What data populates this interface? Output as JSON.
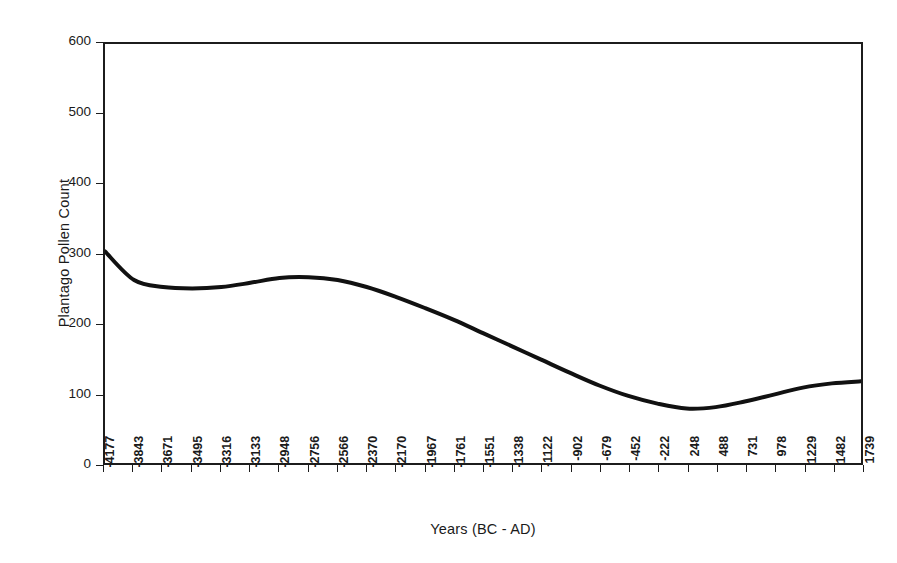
{
  "chart_data": {
    "type": "line",
    "title": "",
    "xlabel": "Years (BC - AD)",
    "ylabel": "Plantago Pollen Count",
    "grid": false,
    "legend": null,
    "ylim": [
      0,
      600
    ],
    "yticks": [
      0,
      100,
      200,
      300,
      400,
      500,
      600
    ],
    "categories": [
      "-4177",
      "-3843",
      "-3671",
      "-3495",
      "-3316",
      "-3133",
      "-2948",
      "-2756",
      "-2566",
      "-2370",
      "-2170",
      "-1967",
      "-1761",
      "-1551",
      "-1338",
      "-1122",
      "-902",
      "-679",
      "-452",
      "-222",
      "248",
      "488",
      "731",
      "978",
      "1229",
      "1482",
      "1739"
    ],
    "x": [
      -4177,
      -3843,
      -3671,
      -3495,
      -3316,
      -3133,
      -2948,
      -2756,
      -2566,
      -2370,
      -2170,
      -1967,
      -1761,
      -1551,
      -1338,
      -1122,
      -902,
      -679,
      -452,
      -222,
      248,
      488,
      731,
      978,
      1229,
      1482,
      1739
    ],
    "values": [
      303,
      262,
      252,
      250,
      252,
      258,
      265,
      266,
      262,
      252,
      238,
      222,
      205,
      186,
      167,
      148,
      129,
      111,
      96,
      85,
      78,
      80,
      88,
      98,
      108,
      114,
      117
    ],
    "series": [
      {
        "name": "Plantago Pollen Count",
        "color": "#111111",
        "line_width": 4,
        "values": [
          303,
          262,
          252,
          250,
          252,
          258,
          265,
          266,
          262,
          252,
          238,
          222,
          205,
          186,
          167,
          148,
          129,
          111,
          96,
          85,
          78,
          80,
          88,
          98,
          108,
          114,
          117
        ]
      }
    ],
    "annotations": {
      "start_value": 303,
      "local_minimum_early": 250,
      "local_maximum_mid": 266,
      "global_minimum": 78,
      "end_value": 117
    }
  },
  "axes": {
    "y_tick_labels": [
      "600",
      "500",
      "400",
      "300",
      "200",
      "100",
      "0"
    ],
    "x_tick_labels": [
      "-4177",
      "-3843",
      "-3671",
      "-3495",
      "-3316",
      "-3133",
      "-2948",
      "-2756",
      "-2566",
      "-2370",
      "-2170",
      "-1967",
      "-1761",
      "-1551",
      "-1338",
      "-1122",
      "-902",
      "-679",
      "-452",
      "-222",
      "248",
      "488",
      "731",
      "978",
      "1229",
      "1482",
      "1739"
    ]
  },
  "colors": {
    "background": "#ffffff",
    "axis": "#1c1c1c",
    "line": "#111111",
    "text": "#1a1a1a"
  }
}
